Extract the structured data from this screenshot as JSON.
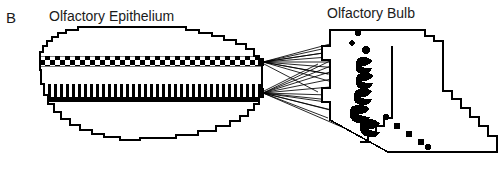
{
  "figure": {
    "panel_label": "B",
    "type": "schematic-diagram",
    "background_color": "#ffffff",
    "ink_color": "#000000",
    "text_color": "#1a1a1a"
  },
  "labels": {
    "epithelium": "Olfactory Epithelium",
    "bulb": "Olfactory Bulb"
  },
  "diagram_data": {
    "type": "schematic",
    "structures": [
      {
        "name": "olfactory-epithelium",
        "outline_style": "pixelated-stepped",
        "bands": [
          {
            "name": "receptor-band-upper",
            "pattern": "checkerboard",
            "rows": 2,
            "cell_size": 5
          },
          {
            "name": "receptor-band-lower",
            "pattern": "vertical-bars",
            "bar_width": 3,
            "gap": 3
          }
        ]
      },
      {
        "name": "olfactory-bulb",
        "outline_style": "stepped-staircase",
        "features": [
          {
            "name": "glomeruli-chain",
            "count": 6,
            "shape": "irregular-blob"
          },
          {
            "name": "glomeruli-dot-trail",
            "count": 7,
            "shape": "round-dot"
          }
        ]
      }
    ],
    "connections": {
      "name": "axon-bundles",
      "from": "olfactory-epithelium-right-edge",
      "to": "olfactory-bulb-glomeruli",
      "convergence_points": 2,
      "line_count": 22,
      "stroke_width": 0.8
    }
  }
}
